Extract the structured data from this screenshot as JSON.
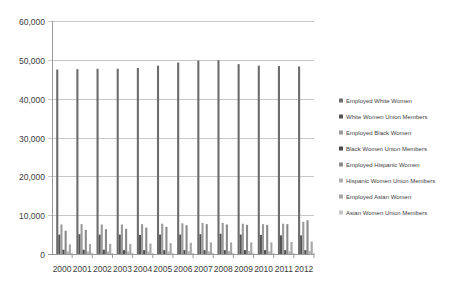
{
  "chart_data": {
    "type": "bar",
    "title": "",
    "xlabel": "",
    "ylabel": "",
    "ylim": [
      0,
      60000
    ],
    "yticks": [
      0,
      10000,
      20000,
      30000,
      40000,
      50000,
      60000
    ],
    "ytick_labels": [
      "0",
      "10,000",
      "20,000",
      "30,000",
      "40,000",
      "50,000",
      "60,000"
    ],
    "grid": true,
    "legend_position": "right",
    "categories": [
      "2000",
      "2001",
      "2002",
      "2003",
      "2004",
      "2005",
      "2006",
      "2007",
      "2008",
      "2009",
      "2010",
      "2011",
      "2012"
    ],
    "series": [
      {
        "name": "Employed White Women",
        "color": "#6d6d6d",
        "values": [
          47500,
          47600,
          47700,
          47700,
          47900,
          48500,
          49300,
          49800,
          49900,
          48900,
          48500,
          48400,
          48300
        ]
      },
      {
        "name": "White Women Union Members",
        "color": "#555555",
        "values": [
          5000,
          5100,
          5000,
          5000,
          4900,
          5000,
          5000,
          5100,
          5200,
          5000,
          4900,
          4800,
          4800
        ]
      },
      {
        "name": "Employed Black Women",
        "color": "#9b9b9b",
        "values": [
          7600,
          7700,
          7600,
          7600,
          7700,
          7800,
          7900,
          8000,
          8000,
          7800,
          7700,
          7800,
          8300
        ]
      },
      {
        "name": "Black Women Union Members",
        "color": "#4a4a4a",
        "values": [
          1100,
          1100,
          1100,
          1000,
          1000,
          1000,
          1000,
          1000,
          1000,
          1000,
          1000,
          1000,
          1000
        ]
      },
      {
        "name": "Employed Hispanic Women",
        "color": "#8a8a8a",
        "values": [
          6000,
          6200,
          6400,
          6500,
          6800,
          7000,
          7400,
          7700,
          7600,
          7500,
          7500,
          7700,
          8700
        ]
      },
      {
        "name": "Hispanic Women Union Members",
        "color": "#b0b0b0",
        "values": [
          650,
          650,
          650,
          650,
          650,
          650,
          700,
          700,
          750,
          750,
          700,
          700,
          750
        ]
      },
      {
        "name": "Employed Asian Women",
        "color": "#a5a5a5",
        "values": [
          2500,
          2600,
          2600,
          2600,
          2700,
          2800,
          2900,
          3000,
          3000,
          3000,
          3000,
          3100,
          3200
        ]
      },
      {
        "name": "Asian Women Union Members",
        "color": "#c4c4c4",
        "values": [
          300,
          300,
          300,
          300,
          300,
          300,
          300,
          300,
          300,
          300,
          300,
          300,
          300
        ]
      }
    ]
  }
}
